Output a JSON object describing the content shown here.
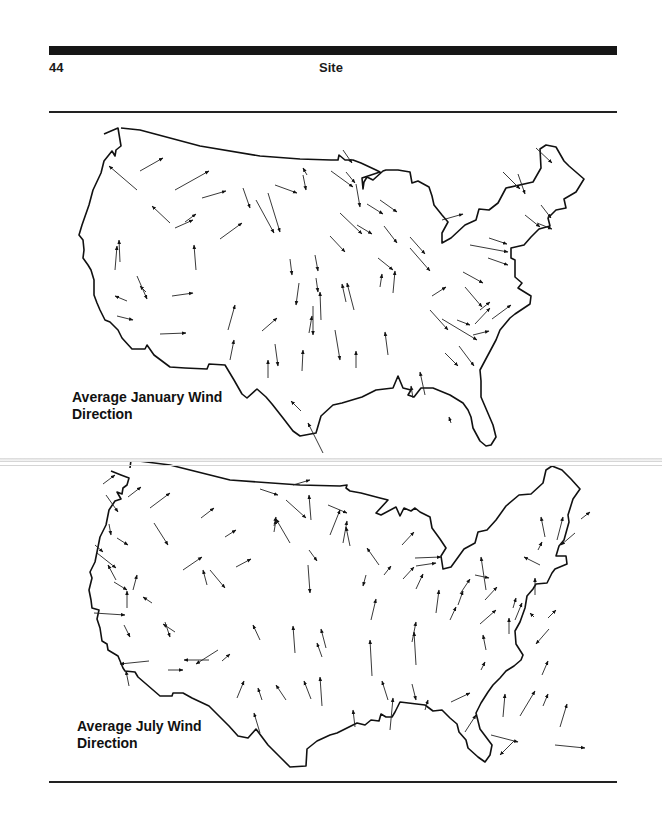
{
  "header": {
    "page_number": "44",
    "running_head": "Site"
  },
  "maps": [
    {
      "id": "january",
      "caption_line1": "Average January Wind",
      "caption_line2": "Direction",
      "arrows": [
        [
          140,
          171,
          163,
          158
        ],
        [
          137,
          190,
          109,
          166
        ],
        [
          175,
          190,
          209,
          171
        ],
        [
          202,
          198,
          226,
          191
        ],
        [
          170,
          223,
          152,
          206
        ],
        [
          175,
          228,
          193,
          220
        ],
        [
          220,
          239,
          242,
          223
        ],
        [
          120,
          262,
          119,
          240
        ],
        [
          115,
          270,
          117,
          246
        ],
        [
          196,
          270,
          194,
          245
        ],
        [
          256,
          200,
          274,
          233
        ],
        [
          275,
          185,
          297,
          193
        ],
        [
          303,
          175,
          306,
          190
        ],
        [
          356,
          184,
          360,
          207
        ],
        [
          268,
          193,
          280,
          232
        ],
        [
          243,
          188,
          250,
          208
        ],
        [
          331,
          171,
          353,
          187
        ],
        [
          307,
          175,
          303,
          168
        ],
        [
          343,
          150,
          352,
          163
        ],
        [
          346,
          172,
          355,
          183
        ],
        [
          380,
          200,
          397,
          212
        ],
        [
          367,
          204,
          383,
          214
        ],
        [
          340,
          213,
          362,
          234
        ],
        [
          357,
          225,
          372,
          234
        ],
        [
          384,
          226,
          397,
          243
        ],
        [
          330,
          236,
          345,
          252
        ],
        [
          410,
          237,
          425,
          254
        ],
        [
          378,
          258,
          393,
          270
        ],
        [
          410,
          248,
          430,
          271
        ],
        [
          442,
          220,
          463,
          214
        ],
        [
          489,
          238,
          507,
          244
        ],
        [
          470,
          245,
          508,
          252
        ],
        [
          488,
          258,
          508,
          265
        ],
        [
          463,
          272,
          483,
          283
        ],
        [
          465,
          287,
          482,
          307
        ],
        [
          503,
          172,
          520,
          189
        ],
        [
          536,
          148,
          552,
          163
        ],
        [
          518,
          174,
          525,
          194
        ],
        [
          525,
          215,
          540,
          227
        ],
        [
          541,
          205,
          551,
          218
        ],
        [
          537,
          223,
          552,
          229
        ],
        [
          380,
          287,
          382,
          274
        ],
        [
          393,
          293,
          395,
          271
        ],
        [
          346,
          302,
          342,
          284
        ],
        [
          354,
          310,
          347,
          283
        ],
        [
          432,
          296,
          446,
          287
        ],
        [
          480,
          310,
          490,
          302
        ],
        [
          442,
          319,
          477,
          340
        ],
        [
          430,
          310,
          448,
          330
        ],
        [
          457,
          320,
          470,
          325
        ],
        [
          459,
          346,
          474,
          366
        ],
        [
          445,
          353,
          458,
          366
        ],
        [
          475,
          324,
          490,
          308
        ],
        [
          492,
          319,
          511,
          305
        ],
        [
          473,
          335,
          489,
          331
        ],
        [
          315,
          255,
          318,
          271
        ],
        [
          290,
          259,
          292,
          275
        ],
        [
          316,
          278,
          318,
          292
        ],
        [
          299,
          283,
          296,
          305
        ],
        [
          313,
          306,
          313,
          335
        ],
        [
          321,
          320,
          320,
          292
        ],
        [
          309,
          333,
          312,
          316
        ],
        [
          262,
          331,
          277,
          318
        ],
        [
          228,
          330,
          235,
          305
        ],
        [
          230,
          360,
          234,
          340
        ],
        [
          268,
          378,
          268,
          360
        ],
        [
          302,
          371,
          303,
          350
        ],
        [
          275,
          344,
          278,
          366
        ],
        [
          356,
          368,
          356,
          351
        ],
        [
          301,
          411,
          291,
          401
        ],
        [
          323,
          453,
          308,
          423
        ],
        [
          335,
          330,
          340,
          360
        ],
        [
          425,
          395,
          420,
          372
        ],
        [
          388,
          355,
          385,
          332
        ],
        [
          413,
          398,
          411,
          386
        ],
        [
          451,
          423,
          449,
          417
        ],
        [
          160,
          334,
          186,
          333
        ],
        [
          172,
          296,
          193,
          293
        ],
        [
          127,
          301,
          115,
          296
        ],
        [
          117,
          316,
          133,
          320
        ],
        [
          146,
          292,
          140,
          286
        ],
        [
          137,
          276,
          147,
          299
        ],
        [
          185,
          222,
          196,
          214
        ]
      ]
    },
    {
      "id": "july",
      "caption_line1": "Average July Wind",
      "caption_line2": "Direction",
      "arrows": [
        [
          103,
          484,
          115,
          475
        ],
        [
          106,
          495,
          118,
          512
        ],
        [
          128,
          497,
          141,
          487
        ],
        [
          150,
          508,
          170,
          493
        ],
        [
          154,
          523,
          168,
          545
        ],
        [
          201,
          518,
          214,
          508
        ],
        [
          225,
          537,
          236,
          530
        ],
        [
          183,
          570,
          202,
          557
        ],
        [
          210,
          570,
          225,
          588
        ],
        [
          207,
          585,
          203,
          570
        ],
        [
          236,
          567,
          251,
          559
        ],
        [
          260,
          489,
          278,
          495
        ],
        [
          274,
          532,
          276,
          520
        ],
        [
          286,
          500,
          306,
          518
        ],
        [
          293,
          485,
          310,
          480
        ],
        [
          311,
          520,
          309,
          495
        ],
        [
          328,
          505,
          347,
          513
        ],
        [
          330,
          535,
          340,
          510
        ],
        [
          290,
          543,
          276,
          519
        ],
        [
          309,
          550,
          317,
          561
        ],
        [
          274,
          526,
          276,
          517
        ],
        [
          222,
          661,
          230,
          654
        ],
        [
          308,
          565,
          310,
          593
        ],
        [
          343,
          543,
          347,
          521
        ],
        [
          350,
          546,
          346,
          527
        ],
        [
          402,
          545,
          414,
          532
        ],
        [
          415,
          558,
          441,
          557
        ],
        [
          416,
          566,
          436,
          563
        ],
        [
          403,
          579,
          414,
          567
        ],
        [
          416,
          589,
          423,
          574
        ],
        [
          379,
          565,
          367,
          548
        ],
        [
          384,
          575,
          391,
          566
        ],
        [
          366,
          575,
          363,
          586
        ],
        [
          436,
          613,
          439,
          590
        ],
        [
          371,
          620,
          376,
          599
        ],
        [
          412,
          642,
          416,
          622
        ],
        [
          372,
          676,
          370,
          640
        ],
        [
          416,
          665,
          414,
          632
        ],
        [
          460,
          594,
          470,
          579
        ],
        [
          485,
          600,
          497,
          587
        ],
        [
          486,
          590,
          481,
          557
        ],
        [
          475,
          575,
          489,
          578
        ],
        [
          458,
          605,
          463,
          591
        ],
        [
          450,
          620,
          456,
          607
        ],
        [
          480,
          624,
          496,
          610
        ],
        [
          486,
          650,
          483,
          635
        ],
        [
          509,
          634,
          509,
          618
        ],
        [
          515,
          620,
          522,
          603
        ],
        [
          535,
          595,
          535,
          578
        ],
        [
          513,
          608,
          516,
          598
        ],
        [
          545,
          537,
          541,
          517
        ],
        [
          538,
          550,
          542,
          542
        ],
        [
          540,
          565,
          524,
          557
        ],
        [
          548,
          618,
          556,
          610
        ],
        [
          534,
          617,
          530,
          613
        ],
        [
          549,
          629,
          536,
          644
        ],
        [
          581,
          519,
          590,
          512
        ],
        [
          557,
          540,
          563,
          517
        ],
        [
          575,
          533,
          561,
          545
        ],
        [
          542,
          675,
          548,
          661
        ],
        [
          481,
          670,
          485,
          662
        ],
        [
          560,
          727,
          567,
          704
        ],
        [
          543,
          706,
          548,
          694
        ],
        [
          520,
          716,
          535,
          691
        ],
        [
          503,
          717,
          505,
          694
        ],
        [
          355,
          727,
          353,
          710
        ],
        [
          388,
          700,
          382,
          681
        ],
        [
          412,
          684,
          416,
          700
        ],
        [
          451,
          702,
          470,
          693
        ],
        [
          465,
          732,
          476,
          715
        ],
        [
          425,
          710,
          428,
          700
        ],
        [
          390,
          730,
          393,
          698
        ],
        [
          322,
          706,
          320,
          677
        ],
        [
          326,
          648,
          321,
          629
        ],
        [
          295,
          653,
          293,
          626
        ],
        [
          260,
          640,
          253,
          625
        ],
        [
          311,
          699,
          304,
          681
        ],
        [
          322,
          657,
          317,
          643
        ],
        [
          262,
          700,
          258,
          688
        ],
        [
          286,
          700,
          276,
          685
        ],
        [
          260,
          733,
          254,
          713
        ],
        [
          237,
          698,
          244,
          681
        ],
        [
          218,
          650,
          196,
          664
        ],
        [
          209,
          660,
          184,
          660
        ],
        [
          168,
          670,
          183,
          670
        ],
        [
          149,
          661,
          120,
          664
        ],
        [
          152,
          603,
          143,
          597
        ],
        [
          175,
          632,
          163,
          624
        ],
        [
          165,
          622,
          170,
          637
        ],
        [
          127,
          608,
          127,
          591
        ],
        [
          116,
          580,
          108,
          565
        ],
        [
          133,
          590,
          137,
          575
        ],
        [
          124,
          625,
          130,
          637
        ],
        [
          94,
          613,
          125,
          615
        ],
        [
          97,
          553,
          116,
          568
        ],
        [
          114,
          582,
          127,
          590
        ],
        [
          117,
          538,
          128,
          545
        ],
        [
          95,
          545,
          103,
          552
        ],
        [
          109,
          524,
          111,
          535
        ],
        [
          129,
          686,
          126,
          671
        ],
        [
          491,
          735,
          518,
          742
        ],
        [
          514,
          741,
          500,
          755
        ],
        [
          555,
          745,
          585,
          748
        ]
      ]
    }
  ]
}
